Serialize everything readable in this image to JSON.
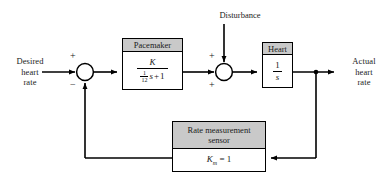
{
  "diagram": {
    "colors": {
      "line": "#000000",
      "block_header_fill": "#c9c9c9",
      "block_body_fill": "#ffffff",
      "background": "#ffffff",
      "text": "#1a1a1a"
    }
  },
  "inputs": {
    "desired": {
      "line1": "Desired",
      "line2": "heart",
      "line3": "rate"
    },
    "disturbance": {
      "label": "Disturbance"
    }
  },
  "outputs": {
    "actual": {
      "line1": "Actual",
      "line2": "heart",
      "line3": "rate"
    }
  },
  "summing_junctions": [
    {
      "id": "sum1",
      "signs": {
        "top": "+",
        "bottom": "−"
      }
    },
    {
      "id": "sum2",
      "signs": {
        "top": "+",
        "bottom": "+"
      }
    }
  ],
  "blocks": {
    "pacemaker": {
      "header": "Pacemaker",
      "transfer_function": {
        "numerator": "K",
        "denominator_coefficient_numerator": "1",
        "denominator_coefficient_denominator": "12",
        "denominator_variable": "s",
        "denominator_plus": "+",
        "denominator_constant": "1",
        "plain": "K / ((1/12)s + 1)"
      }
    },
    "heart": {
      "header": "Heart",
      "transfer_function": {
        "numerator": "1",
        "denominator": "s",
        "plain": "1/s"
      }
    },
    "sensor": {
      "header_line1": "Rate measurement",
      "header_line2": "sensor",
      "gain_symbol": "K",
      "gain_subscript": "m",
      "gain_equals": "=",
      "gain_value": "1",
      "plain": "K_m = 1"
    }
  }
}
